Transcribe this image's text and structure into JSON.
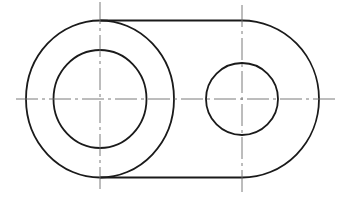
{
  "diagram": {
    "type": "engineering-drawing",
    "canvas": {
      "width": 359,
      "height": 221,
      "background": "#ffffff"
    },
    "colors": {
      "outline": "#1a1a1a",
      "centerline": "#6b6b6b"
    },
    "left_boss": {
      "center": [
        100,
        99
      ],
      "outer": {
        "rx": 74,
        "ry": 78.5
      },
      "inner_hole": {
        "rx": 46.5,
        "ry": 49
      }
    },
    "right_end": {
      "center": [
        242,
        99
      ],
      "arc": {
        "rx": 77,
        "ry": 78.5
      },
      "hole": {
        "rx": 36,
        "ry": 36
      }
    },
    "tangent_lines": {
      "top_y": 20.5,
      "bottom_y": 177.5,
      "x_start": 100,
      "x_end": 242
    },
    "centerlines": {
      "horizontal": {
        "y": 99,
        "x1": 16,
        "x2": 337
      },
      "left_vertical": {
        "x": 100,
        "y1": 2,
        "y2": 193
      },
      "right_vertical": {
        "x": 242,
        "y1": 5,
        "y2": 192
      }
    }
  }
}
